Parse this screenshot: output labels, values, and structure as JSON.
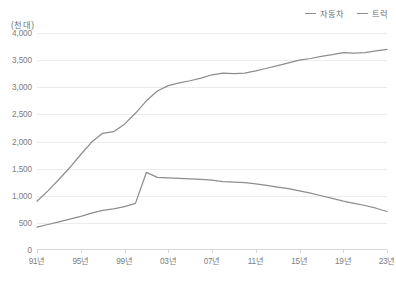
{
  "chart_data": {
    "type": "line",
    "title": "",
    "subtitle": "",
    "unit_label": "(천 대)",
    "xlabel": "",
    "ylabel": "",
    "ylim": [
      0,
      4000
    ],
    "ytick_step": 500,
    "ytick_labels": [
      "4,000",
      "3,500",
      "3,000",
      "2,500",
      "2,000",
      "1,500",
      "1,000",
      "500",
      "0"
    ],
    "ytick_values": [
      4000,
      3500,
      3000,
      2500,
      2000,
      1500,
      1000,
      500,
      0
    ],
    "xtick_labels": [
      "91년",
      "95년",
      "99년",
      "03년",
      "07년",
      "11년",
      "15년",
      "19년",
      "23년"
    ],
    "xtick_values": [
      1991,
      1995,
      1999,
      2003,
      2007,
      2011,
      2015,
      2019,
      2023
    ],
    "xlim": [
      1991,
      2023
    ],
    "grid": true,
    "legend_position": "top-right",
    "x": [
      1991,
      1992,
      1993,
      1994,
      1995,
      1996,
      1997,
      1998,
      1999,
      2000,
      2001,
      2002,
      2003,
      2004,
      2005,
      2006,
      2007,
      2008,
      2009,
      2010,
      2011,
      2012,
      2013,
      2014,
      2015,
      2016,
      2017,
      2018,
      2019,
      2020,
      2021,
      2022,
      2023
    ],
    "series": [
      {
        "name": "자동차",
        "color": "#8d8d8d",
        "values": [
          900,
          1090,
          1300,
          1520,
          1760,
          1990,
          2150,
          2180,
          2320,
          2520,
          2750,
          2930,
          3030,
          3080,
          3120,
          3170,
          3230,
          3260,
          3250,
          3260,
          3300,
          3350,
          3400,
          3450,
          3500,
          3530,
          3570,
          3600,
          3640,
          3630,
          3640,
          3670,
          3700
        ]
      },
      {
        "name": "트럭",
        "color": "#8d8d8d",
        "values": [
          420,
          470,
          520,
          570,
          620,
          680,
          730,
          760,
          800,
          860,
          1430,
          1340,
          1330,
          1320,
          1310,
          1300,
          1290,
          1260,
          1250,
          1240,
          1220,
          1190,
          1160,
          1130,
          1090,
          1050,
          1000,
          950,
          900,
          860,
          820,
          770,
          710
        ]
      }
    ]
  }
}
